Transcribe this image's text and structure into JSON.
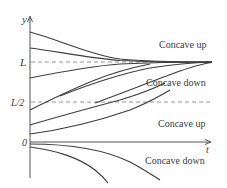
{
  "diagram": {
    "type": "solution-curves",
    "axes": {
      "y_label": "y",
      "x_label": "t",
      "ticks": {
        "L": "L",
        "half_L": "L/2",
        "zero": "0"
      }
    },
    "region_labels": {
      "above_L": "Concave up",
      "between_half_and_L": "Concave down",
      "between_zero_and_half": "Concave up",
      "below_zero": "Concave down"
    },
    "equilibria": [
      {
        "name": "L",
        "style": "dashed"
      },
      {
        "name": "L/2",
        "style": "dashed"
      }
    ],
    "curve_groups": [
      {
        "region": "above L",
        "count": 2,
        "behavior": "decreasing toward L"
      },
      {
        "region": "L/2 to L",
        "count": 2,
        "behavior": "increasing toward L"
      },
      {
        "region": "0 to L/2",
        "count": 3,
        "behavior": "increasing, inflection at L/2"
      },
      {
        "region": "below 0",
        "count": 2,
        "behavior": "decreasing away from 0"
      }
    ],
    "colors": {
      "curve": "#3d3d3d",
      "dashed": "#8a8a8a",
      "text": "#3a3a3a",
      "background": "#ffffff"
    }
  }
}
